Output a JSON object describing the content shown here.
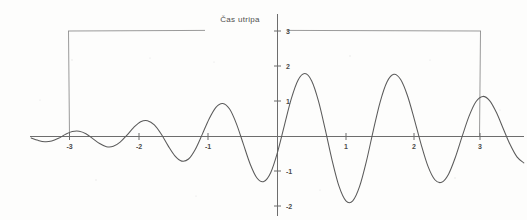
{
  "chart_data": {
    "type": "line",
    "title": "",
    "xlabel": "",
    "ylabel": "",
    "xlim": [
      -3.65,
      3.65
    ],
    "ylim": [
      -2.45,
      3.35
    ],
    "grid": false,
    "legend_position": "none",
    "x_ticks": [
      -3,
      -2,
      -1,
      1,
      2,
      3
    ],
    "x_tick_labels": [
      "-3",
      "-2",
      "-1",
      "1",
      "2",
      "3"
    ],
    "y_ticks": [
      -2,
      -1,
      1,
      2,
      3
    ],
    "y_tick_labels": [
      "-2",
      "-1",
      "1",
      "2",
      "3"
    ],
    "series": [
      {
        "name": "wave-packet",
        "description": "Symmetric damped oscillation (wave packet), amplitude envelope peaks at x=0 reaching +2 and -2, decaying toward x=+/-3.5",
        "color": "#5a5a5a",
        "x": [
          -3.6,
          -3.5,
          -3.4,
          -3.3,
          -3.2,
          -3.1,
          -3.0,
          -2.9,
          -2.8,
          -2.7,
          -2.6,
          -2.5,
          -2.4,
          -2.3,
          -2.2,
          -2.1,
          -2.0,
          -1.9,
          -1.8,
          -1.7,
          -1.6,
          -1.5,
          -1.4,
          -1.3,
          -1.2,
          -1.1,
          -1.0,
          -0.9,
          -0.8,
          -0.7,
          -0.6,
          -0.5,
          -0.4,
          -0.3,
          -0.2,
          -0.1,
          0.0,
          0.1,
          0.2,
          0.3,
          0.4,
          0.5,
          0.6,
          0.7,
          0.8,
          0.9,
          1.0,
          1.1,
          1.2,
          1.3,
          1.4,
          1.5,
          1.6,
          1.7,
          1.8,
          1.9,
          2.0,
          2.1,
          2.2,
          2.3,
          2.4,
          2.5,
          2.6,
          2.7,
          2.8,
          2.9,
          3.0,
          3.1,
          3.2,
          3.3,
          3.4,
          3.5,
          3.6
        ],
        "y": [
          -0.04,
          -0.11,
          -0.15,
          -0.13,
          -0.05,
          0.06,
          0.14,
          0.15,
          0.08,
          -0.06,
          -0.2,
          -0.29,
          -0.28,
          -0.16,
          0.04,
          0.26,
          0.42,
          0.45,
          0.33,
          0.07,
          -0.26,
          -0.55,
          -0.7,
          -0.64,
          -0.36,
          0.06,
          0.5,
          0.83,
          0.94,
          0.78,
          0.36,
          -0.21,
          -0.78,
          -1.18,
          -1.28,
          -1.03,
          -0.45,
          0.31,
          1.06,
          1.6,
          1.79,
          1.58,
          1.0,
          0.18,
          -0.69,
          -1.42,
          -1.83,
          -1.83,
          -1.42,
          -0.7,
          0.17,
          0.98,
          1.55,
          1.77,
          1.62,
          1.16,
          0.49,
          -0.23,
          -0.85,
          -1.23,
          -1.3,
          -1.07,
          -0.59,
          0.01,
          0.58,
          0.99,
          1.14,
          1.02,
          0.68,
          0.22,
          -0.23,
          -0.58,
          -0.75
        ]
      }
    ],
    "annotations": [
      {
        "name": "pulse-duration-bracket",
        "label": "Čas utripa",
        "type": "span-bracket",
        "x_start": -3,
        "x_end": 3,
        "y_level": 3,
        "label_x": -0.6,
        "label_y": 3.25
      }
    ]
  },
  "annotation": {
    "pulse_label": "Čas utripa"
  },
  "axes": {
    "x_tick_labels": [
      "-3",
      "-2",
      "-1",
      "1",
      "2",
      "3"
    ],
    "y_tick_labels": [
      "3",
      "2",
      "1",
      "-1",
      "-2"
    ]
  },
  "colors": {
    "curve": "#5a5a5a",
    "axis": "#6d6d6d",
    "bracket": "#8e8e8e",
    "label_text": "#4a4a4a",
    "background": "#fdfdfc"
  }
}
